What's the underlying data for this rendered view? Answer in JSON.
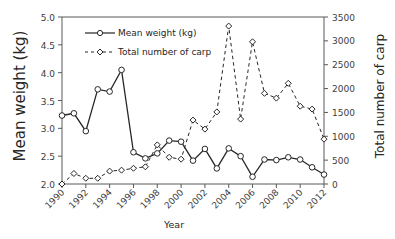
{
  "chart_data": {
    "type": "line",
    "title": "",
    "xlabel": "Year",
    "ylabel": "Mean weight (kg)",
    "y2label": "Total number of carp",
    "x": [
      1990,
      1991,
      1992,
      1993,
      1994,
      1995,
      1996,
      1997,
      1998,
      1999,
      2000,
      2001,
      2002,
      2003,
      2004,
      2005,
      2006,
      2007,
      2008,
      2009,
      2010,
      2011,
      2012
    ],
    "x_ticks": [
      "1990",
      "1992",
      "1994",
      "1996",
      "1998",
      "2000",
      "2002",
      "2004",
      "2006",
      "2008",
      "2010",
      "2012"
    ],
    "xlim": [
      1990,
      2012
    ],
    "ylim": [
      2.0,
      5.0
    ],
    "y_ticks": [
      "2.0",
      "2.5",
      "3.0",
      "3.5",
      "4.0",
      "4.5",
      "5.0"
    ],
    "y2lim": [
      0,
      3500
    ],
    "y2_ticks": [
      "0",
      "500",
      "1000",
      "1500",
      "2000",
      "2500",
      "3000",
      "3500"
    ],
    "grid": false,
    "legend_position": "upper left",
    "series": [
      {
        "name": "Mean weight (kg)",
        "axis": "left",
        "style": "solid",
        "marker": "circle",
        "values": [
          3.23,
          3.27,
          2.95,
          3.7,
          3.66,
          4.05,
          2.57,
          2.46,
          2.55,
          2.78,
          2.76,
          2.42,
          2.63,
          2.28,
          2.64,
          2.5,
          2.13,
          2.44,
          2.43,
          2.48,
          2.44,
          2.3,
          2.17
        ]
      },
      {
        "name": "Total number of carp",
        "axis": "right",
        "style": "dashed",
        "marker": "diamond",
        "values": [
          0,
          220,
          120,
          120,
          270,
          290,
          330,
          360,
          820,
          560,
          520,
          1340,
          1150,
          1510,
          3310,
          1360,
          2980,
          1900,
          1800,
          2110,
          1630,
          1570,
          940
        ]
      }
    ]
  }
}
